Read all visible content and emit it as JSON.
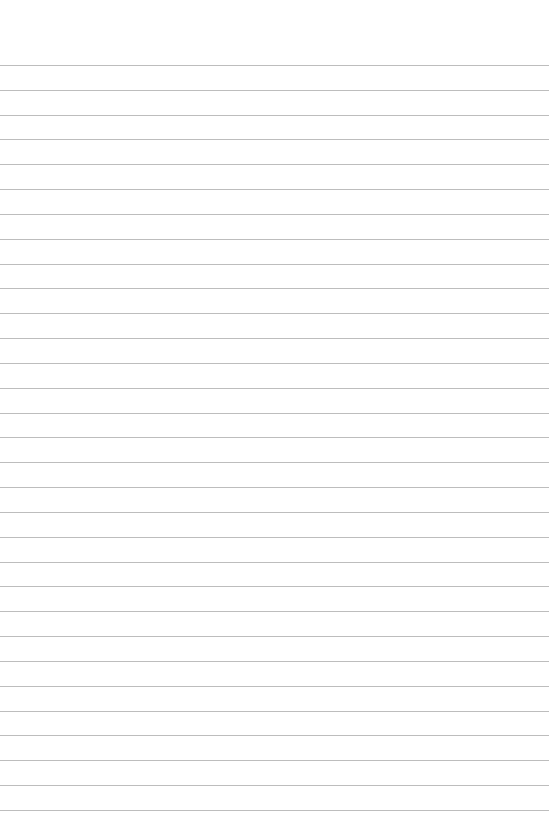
{
  "page": {
    "type": "lined-paper",
    "background_color": "#ffffff",
    "line_color": "#bdbdbd",
    "line_count": 31,
    "first_line_y": 65,
    "line_spacing": 24.83,
    "line_width": 549
  }
}
